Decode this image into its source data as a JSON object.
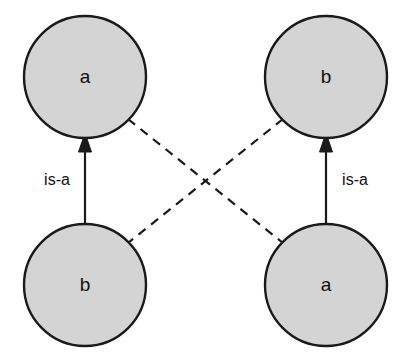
{
  "diagram": {
    "title": "",
    "background_color": "#ffffff",
    "node_fill_color": "#d4d4d4",
    "node_stroke_color": "#1a1a1a",
    "edge_color": "#1a1a1a",
    "nodes": [
      {
        "id": "top-left",
        "label": "a",
        "cx": 85,
        "cy": 77,
        "r": 61
      },
      {
        "id": "top-right",
        "label": "b",
        "cx": 326,
        "cy": 77,
        "r": 61
      },
      {
        "id": "bottom-left",
        "label": "b",
        "cx": 85,
        "cy": 285,
        "r": 61
      },
      {
        "id": "bottom-right",
        "label": "a",
        "cx": 326,
        "cy": 285,
        "r": 61
      }
    ],
    "edges": [
      {
        "id": "left-is-a",
        "from": "bottom-left",
        "to": "top-left",
        "style": "solid",
        "arrow": "to",
        "label": "is-a",
        "label_x": 57,
        "label_y": 181
      },
      {
        "id": "right-is-a",
        "from": "bottom-right",
        "to": "top-right",
        "style": "solid",
        "arrow": "to",
        "label": "is-a",
        "label_x": 355,
        "label_y": 181
      },
      {
        "id": "cross-tl-br",
        "from": "top-left",
        "to": "bottom-right",
        "style": "dashed",
        "arrow": "none",
        "label": ""
      },
      {
        "id": "cross-tr-bl",
        "from": "top-right",
        "to": "bottom-left",
        "style": "dashed",
        "arrow": "none",
        "label": ""
      }
    ]
  }
}
